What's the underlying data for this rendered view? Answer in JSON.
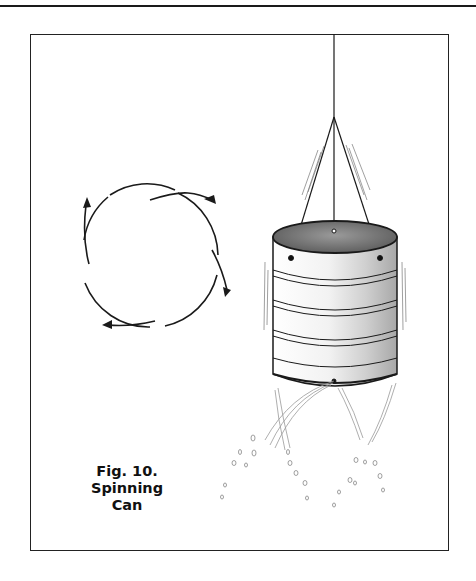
{
  "figure": {
    "number_label": "Fig. 10.",
    "title_line1": "Spinning",
    "title_line2": "Can"
  },
  "illustration": {
    "subject": "can suspended by strings, spinning while water jets spray from holes near its base",
    "rotation_diagram": "circle with four curved arrows indicating rotation",
    "colors": {
      "ink": "#1a1a1a",
      "shading": "#8a8a8a",
      "background": "#ffffff"
    }
  }
}
